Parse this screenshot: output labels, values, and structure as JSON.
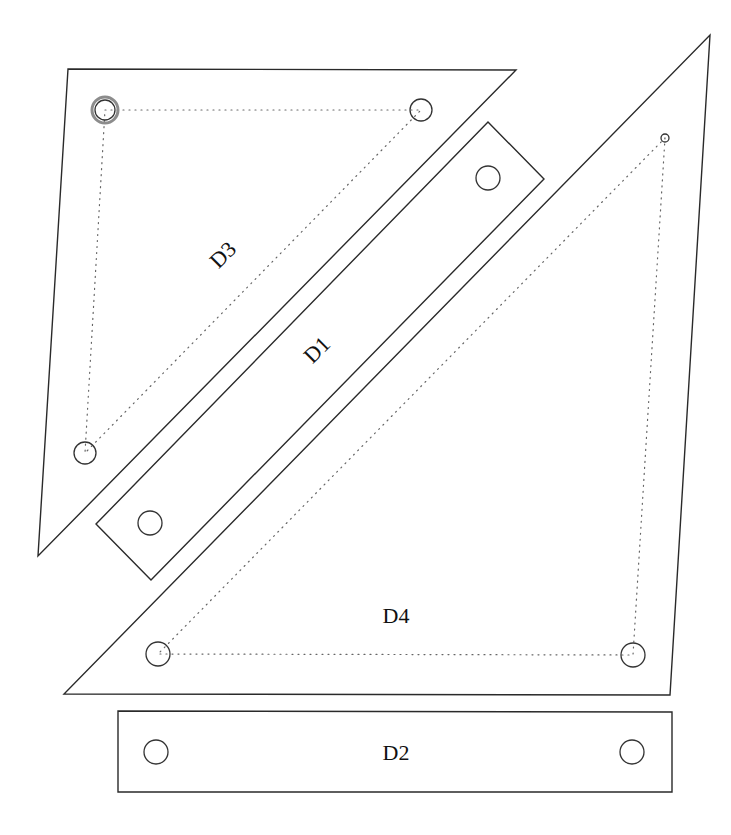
{
  "diagram": {
    "title": "",
    "pieces": [
      {
        "id": "D3",
        "label": "D3",
        "shape": "triangle",
        "outline": [
          [
            68,
            69
          ],
          [
            516,
            70
          ],
          [
            38,
            556
          ]
        ],
        "holes": [
          {
            "cx": 105,
            "cy": 110,
            "r": 10,
            "double": true
          },
          {
            "cx": 421,
            "cy": 110,
            "r": 11
          },
          {
            "cx": 85,
            "cy": 453,
            "r": 11
          }
        ],
        "dotted_path": [
          [
            105,
            110
          ],
          [
            421,
            110
          ],
          [
            85,
            453
          ],
          [
            105,
            110
          ]
        ],
        "label_pos": [
          228,
          260
        ],
        "label_rotation": -45
      },
      {
        "id": "D1",
        "label": "D1",
        "shape": "rotated-rectangle",
        "outline": [
          [
            488,
            122
          ],
          [
            544,
            179
          ],
          [
            151,
            580
          ],
          [
            96,
            524
          ]
        ],
        "holes": [
          {
            "cx": 488,
            "cy": 178,
            "r": 12
          },
          {
            "cx": 150,
            "cy": 523,
            "r": 12
          }
        ],
        "label_pos": [
          322,
          355
        ],
        "label_rotation": -45
      },
      {
        "id": "D4",
        "label": "D4",
        "shape": "triangle",
        "outline": [
          [
            710,
            35
          ],
          [
            670,
            695
          ],
          [
            64,
            694
          ]
        ],
        "holes": [
          {
            "cx": 665,
            "cy": 138,
            "r": 4
          },
          {
            "cx": 633,
            "cy": 655,
            "r": 12
          },
          {
            "cx": 158,
            "cy": 654,
            "r": 12
          }
        ],
        "dotted_path": [
          [
            665,
            138
          ],
          [
            633,
            655
          ],
          [
            158,
            654
          ],
          [
            665,
            138
          ]
        ],
        "label_pos": [
          396,
          623
        ],
        "label_rotation": 0
      },
      {
        "id": "D2",
        "label": "D2",
        "shape": "rectangle",
        "outline": [
          [
            118,
            711
          ],
          [
            672,
            712
          ],
          [
            672,
            792
          ],
          [
            118,
            792
          ]
        ],
        "holes": [
          {
            "cx": 156,
            "cy": 752,
            "r": 12
          },
          {
            "cx": 632,
            "cy": 752,
            "r": 12
          }
        ],
        "label_pos": [
          396,
          760
        ],
        "label_rotation": 0
      }
    ]
  }
}
